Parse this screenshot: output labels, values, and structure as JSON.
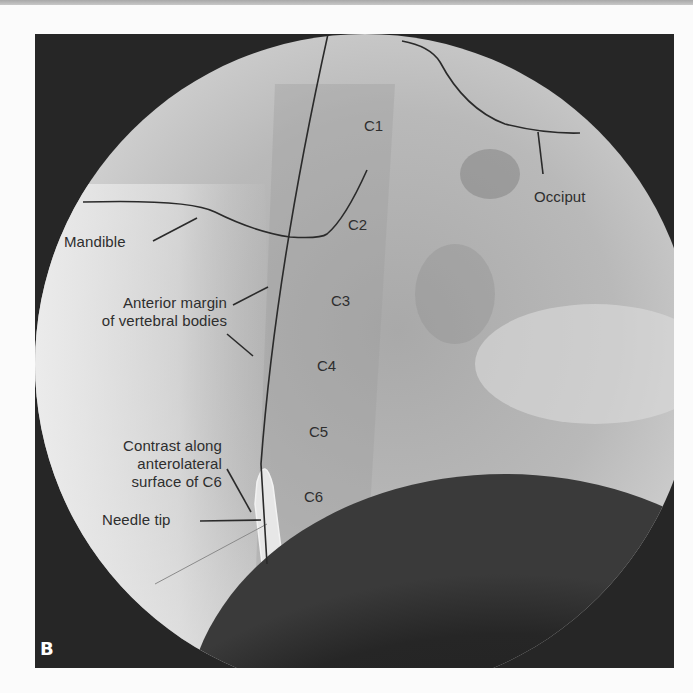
{
  "figure": {
    "panel_letter": "B",
    "image_type": "lateral cervical fluoroscopy",
    "vertebra_labels": [
      "C1",
      "C2",
      "C3",
      "C4",
      "C5",
      "C6"
    ],
    "annotations": {
      "occiput": "Occiput",
      "mandible": "Mandible",
      "anterior_margin_line1": "Anterior margin",
      "anterior_margin_line2": "of vertebral bodies",
      "contrast_line1": "Contrast along",
      "contrast_line2": "anterolateral",
      "contrast_line3": "surface of C6",
      "needle_tip": "Needle tip"
    },
    "colors": {
      "background": "#262626",
      "field": "#bdbdbd",
      "annotation_line": "#2a2a2a",
      "label_text": "#2e2e2e",
      "panel_letter": "#ffffff"
    }
  }
}
